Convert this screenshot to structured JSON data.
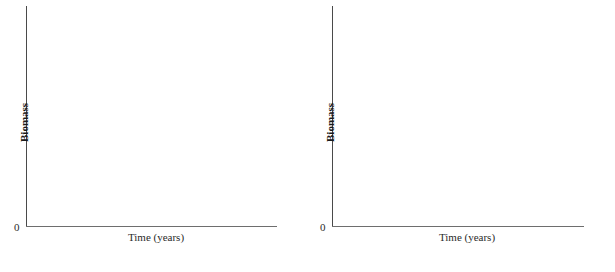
{
  "figure": {
    "background_color": "#ffffff",
    "axis_color": "#4a4a4a",
    "text_color": "#1a1a1a",
    "panel_count": 2
  },
  "panels": [
    {
      "id": "left",
      "origin_label": "0",
      "x_axis_title": "Time (years)",
      "y_axis_title": "Biomass"
    },
    {
      "id": "right",
      "origin_label": "0",
      "x_axis_title": "Time (years)",
      "y_axis_title": "Biomass"
    }
  ],
  "chart_data": [
    {
      "type": "line",
      "title": "",
      "subtitle": "",
      "xlabel": "Time (years)",
      "ylabel": "Biomass",
      "origin_label": "0",
      "x": [],
      "values": [],
      "series": [],
      "tick_labels": {
        "x": [],
        "y": [
          "0"
        ]
      },
      "xlim": null,
      "ylim": null,
      "grid": false,
      "legend": false,
      "legend_position": "none",
      "annotations": [],
      "note": "Blank axes template — no data plotted in the left panel."
    },
    {
      "type": "line",
      "title": "",
      "subtitle": "",
      "xlabel": "Time (years)",
      "ylabel": "Biomass",
      "origin_label": "0",
      "x": [],
      "values": [],
      "series": [],
      "tick_labels": {
        "x": [],
        "y": [
          "0"
        ]
      },
      "xlim": null,
      "ylim": null,
      "grid": false,
      "legend": false,
      "legend_position": "none",
      "annotations": [],
      "note": "Blank axes template — no data plotted in the right panel."
    }
  ]
}
